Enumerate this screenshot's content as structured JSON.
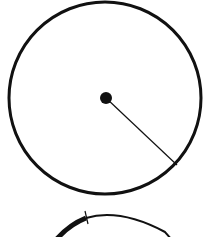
{
  "diagram": {
    "background": "#ffffff",
    "stroke_color": "#111111",
    "circle_top": {
      "cx": 105,
      "cy": 98,
      "r": 96,
      "stroke_width": 3
    },
    "center_dot": {
      "cx": 106,
      "cy": 98,
      "r": 6
    },
    "radius_line": {
      "x1": 106,
      "y1": 98,
      "x2": 177,
      "y2": 165,
      "stroke_width": 1.2
    },
    "circle_bottom_partial": {
      "thick_arc": "M 52 245 Q 66 226 86 218",
      "thin_arc": "M 86 218 Q 120 208 165 232 L 172 240",
      "tick": {
        "x1": 85,
        "y1": 211,
        "x2": 88,
        "y2": 224
      }
    }
  }
}
